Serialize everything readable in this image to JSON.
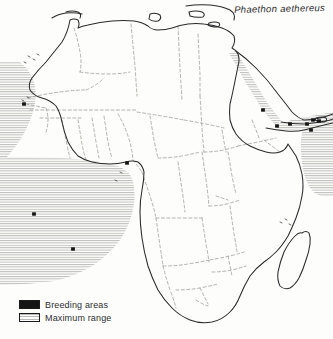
{
  "figure": {
    "kind": "distribution-map",
    "region": "Africa, Mediterranean and western Indian Ocean",
    "species_name": "Phaethon aethereus"
  },
  "colors": {
    "breeding": "#151515",
    "range_hatch": "#b8b8b4",
    "coastline": "#2a2a2a",
    "border": "#8d8d88",
    "background": "#fdfdfc",
    "text": "#2e2e2e"
  },
  "legend": {
    "items": [
      {
        "swatch": "solid-black",
        "label": "Breeding areas"
      },
      {
        "swatch": "horizontal-hatch",
        "label": "Maximum range"
      }
    ]
  },
  "map_data": {
    "type": "choropleth-point-map",
    "breeding_points": [
      {
        "name": "cape-verde-senegal-coast",
        "x": 24,
        "y": 104
      },
      {
        "name": "gulf-of-guinea-coast",
        "x": 127,
        "y": 163
      },
      {
        "name": "south-atlantic-island-north",
        "x": 34,
        "y": 214
      },
      {
        "name": "south-atlantic-island-south",
        "x": 73,
        "y": 249
      },
      {
        "name": "red-sea-island",
        "x": 263,
        "y": 110
      },
      {
        "name": "gulf-of-aden-west",
        "x": 277,
        "y": 126
      },
      {
        "name": "gulf-of-aden-mid",
        "x": 290,
        "y": 124
      },
      {
        "name": "horn-of-africa-coast",
        "x": 307,
        "y": 124
      },
      {
        "name": "socotra-west",
        "x": 313,
        "y": 120
      },
      {
        "name": "socotra-east",
        "x": 319,
        "y": 121
      },
      {
        "name": "arabian-sea-island",
        "x": 311,
        "y": 130
      }
    ],
    "range_bands": [
      {
        "name": "east-atlantic-band",
        "description": "hatched band along NW African Atlantic coast"
      },
      {
        "name": "gulf-of-guinea-band",
        "description": "hatched band off Gulf of Guinea and south Atlantic"
      },
      {
        "name": "red-sea-band",
        "description": "hatched band through the Red Sea"
      },
      {
        "name": "somali-coast-band",
        "description": "hatched band along Somali coast and Arabian Sea"
      }
    ]
  }
}
